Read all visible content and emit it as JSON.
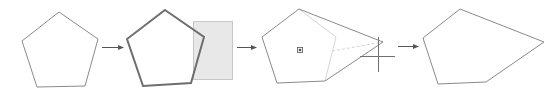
{
  "diagram": {
    "colors": {
      "outline": "#8a8a8a",
      "selected_outline": "#6e6e6e",
      "arrow": "#555555",
      "selection_fill": "#e8e8e8",
      "selection_border": "#9a9a9a",
      "ghost": "#d6d6d6",
      "crosshair": "#707070",
      "marker": "#555555"
    },
    "steps": [
      {
        "name": "original-pentagon",
        "points": "59,12 98,39 85,86 37,87 22,41"
      },
      {
        "name": "selected-pentagon",
        "points": "165,10 204,37 191,83 143,86 127,39",
        "selection_rect": {
          "x": 193,
          "y": 21,
          "w": 39,
          "h": 58
        }
      },
      {
        "name": "dragging-vertex",
        "points": "299,9 383,42 325,81 277,83 262,37",
        "ghost_lines": [
          {
            "x1": 299,
            "y1": 9,
            "x2": 336,
            "y2": 37
          },
          {
            "x1": 336,
            "y1": 37,
            "x2": 325,
            "y2": 81
          },
          {
            "x1": 332,
            "y1": 51,
            "x2": 383,
            "y2": 42
          }
        ],
        "center_marker": {
          "x": 300,
          "y": 50
        },
        "crosshair": {
          "x": 378,
          "y": 56,
          "v_top": 37,
          "v_bottom": 72,
          "h_left": 360,
          "h_right": 395
        }
      },
      {
        "name": "reshaped-polygon",
        "points": "460,9 544,42 486,82 438,84 423,38"
      }
    ],
    "arrows": [
      {
        "name": "arrow-1",
        "x1": 102,
        "x2": 123,
        "y": 47
      },
      {
        "name": "arrow-2",
        "x1": 237,
        "x2": 256,
        "y": 47
      },
      {
        "name": "arrow-3",
        "x1": 398,
        "x2": 418,
        "y": 46
      }
    ]
  }
}
